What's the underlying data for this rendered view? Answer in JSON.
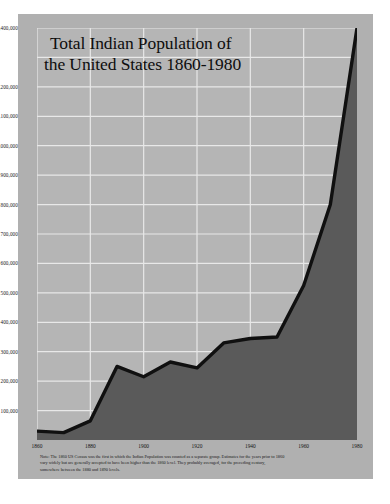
{
  "title": {
    "line1": "Total Indian Population of",
    "line2": "the United States 1860-1980"
  },
  "footnote": {
    "line1": "Note: The 1860 US Census was the first in which the Indian Population was counted as a separate group. Estimates for the years prior to 1860",
    "line2": "vary widely but are generally accepted to have been higher than the 1860 level. They probably averaged, for the preceding century,",
    "line3": "somewhere between the 1880 and 1890 levels."
  },
  "colors": {
    "card_background": "#b0b0b0",
    "plot_background": "#b5b5b5",
    "gridline": "#e8e8e8",
    "area_fill": "#5a5a5a",
    "line_stroke": "#101010",
    "text": "#151515"
  },
  "chart_data": {
    "type": "area",
    "title": "Total Indian Population of the United States 1860-1980",
    "xlabel": "",
    "ylabel": "",
    "xlim": [
      1860,
      1980
    ],
    "ylim": [
      0,
      1400000
    ],
    "grid": true,
    "legend": null,
    "x_ticks": [
      1860,
      1880,
      1900,
      1920,
      1940,
      1960,
      1980
    ],
    "x_tick_labels": [
      "1860",
      "1880",
      "1900",
      "1920",
      "1940",
      "1960",
      "1980"
    ],
    "y_ticks": [
      100000,
      200000,
      300000,
      400000,
      500000,
      600000,
      700000,
      800000,
      900000,
      1000000,
      1100000,
      1200000,
      1300000,
      1400000
    ],
    "y_tick_labels": [
      "100,000",
      "200,000",
      "300,000",
      "400,000",
      "500,000",
      "600,000",
      "700,000",
      "800,000",
      "900,000",
      "1,000,000",
      "1,100,000",
      "1,200,000",
      "1,300,000",
      "1,400,000"
    ],
    "y_tick_labels_hidden": [
      "1,300,000"
    ],
    "x": [
      1860,
      1870,
      1880,
      1890,
      1900,
      1910,
      1920,
      1930,
      1940,
      1950,
      1960,
      1970,
      1980
    ],
    "values": [
      30000,
      25000,
      65000,
      250000,
      215000,
      265000,
      245000,
      330000,
      345000,
      350000,
      525000,
      800000,
      1400000
    ],
    "series": [
      {
        "name": "Total Indian Population",
        "values": [
          30000,
          25000,
          65000,
          250000,
          215000,
          265000,
          245000,
          330000,
          345000,
          350000,
          525000,
          800000,
          1400000
        ]
      }
    ]
  }
}
